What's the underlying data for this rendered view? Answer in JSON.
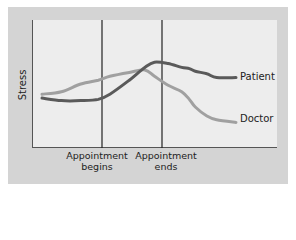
{
  "chart_data": {
    "type": "line",
    "title": "",
    "xlabel": "",
    "ylabel": "Stress",
    "grid": false,
    "legend_position": "inline-right",
    "x_markers": [
      {
        "label": "Appointment begins",
        "line1": "Appointment",
        "line2": "begins",
        "x": 0.29
      },
      {
        "label": "Appointment ends",
        "line1": "Appointment",
        "line2": "ends",
        "x": 0.53
      }
    ],
    "x": [
      0.0,
      0.1,
      0.2,
      0.29,
      0.35,
      0.45,
      0.53,
      0.58,
      0.65,
      0.72,
      0.76,
      0.79,
      0.85,
      0.9,
      1.0
    ],
    "series": [
      {
        "name": "Patient",
        "color": "#5a5a5a",
        "values": [
          0.39,
          0.37,
          0.37,
          0.38,
          0.42,
          0.53,
          0.63,
          0.67,
          0.66,
          0.63,
          0.62,
          0.6,
          0.58,
          0.55,
          0.55
        ]
      },
      {
        "name": "Doctor",
        "color": "#a0a0a0",
        "values": [
          0.42,
          0.44,
          0.5,
          0.53,
          0.56,
          0.59,
          0.61,
          0.56,
          0.49,
          0.44,
          0.38,
          0.32,
          0.25,
          0.22,
          0.2
        ]
      }
    ],
    "ylim": [
      0,
      1
    ]
  },
  "labels": {
    "ylabel": "Stress",
    "marker1_line1": "Appointment",
    "marker1_line2": "begins",
    "marker2_line1": "Appointment",
    "marker2_line2": "ends",
    "patient": "Patient",
    "doctor": "Doctor"
  }
}
